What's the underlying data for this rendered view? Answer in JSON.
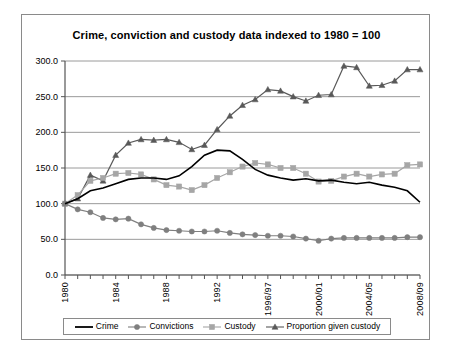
{
  "chart_data": {
    "type": "line",
    "title": "Crime, conviction and custody data indexed to 1980 = 100",
    "xlabel": "",
    "ylabel": "",
    "ylim": [
      0,
      300
    ],
    "yticks": [
      "0.0",
      "50.0",
      "100.0",
      "150.0",
      "200.0",
      "250.0",
      "300.0"
    ],
    "ytick_values": [
      0,
      50,
      100,
      150,
      200,
      250,
      300
    ],
    "grid": true,
    "legend_position": "bottom",
    "x": [
      "1980",
      "1981",
      "1982",
      "1983",
      "1984",
      "1985",
      "1986",
      "1987",
      "1988",
      "1989",
      "1990",
      "1991",
      "1992",
      "1993",
      "1994",
      "1995",
      "1996/97",
      "1997/98",
      "1998/99",
      "1999/00",
      "2000/01",
      "2001/02",
      "2002/03",
      "2003/04",
      "2004/05",
      "2005/06",
      "2006/07",
      "2007/08",
      "2008/09"
    ],
    "xtick_labels": [
      "1980",
      "1984",
      "1988",
      "1992",
      "1996/97",
      "2000/01",
      "2004/05",
      "2008/09"
    ],
    "xtick_indices": [
      0,
      4,
      8,
      12,
      16,
      20,
      24,
      28
    ],
    "series": [
      {
        "name": "Crime",
        "marker": "none",
        "color": "#000000",
        "values": [
          100,
          107,
          118,
          122,
          128,
          134,
          136,
          136,
          134,
          139,
          152,
          168,
          175,
          174,
          162,
          148,
          140,
          136,
          133,
          135,
          132,
          133,
          130,
          128,
          130,
          126,
          123,
          118,
          102
        ]
      },
      {
        "name": "Convictions",
        "marker": "circle",
        "color": "#7f7f7f",
        "values": [
          100,
          92,
          88,
          80,
          78,
          79,
          71,
          66,
          63,
          62,
          61,
          61,
          62,
          59,
          57,
          56,
          55,
          55,
          54,
          51,
          48,
          51,
          52,
          52,
          52,
          52,
          52,
          53,
          53
        ]
      },
      {
        "name": "Custody",
        "marker": "square",
        "color": "#a6a6a6",
        "values": [
          100,
          112,
          132,
          136,
          142,
          143,
          141,
          134,
          126,
          124,
          119,
          126,
          136,
          144,
          152,
          157,
          155,
          150,
          150,
          142,
          131,
          132,
          138,
          142,
          138,
          141,
          142,
          154,
          155
        ]
      },
      {
        "name": "Proportion given custody",
        "marker": "triangle",
        "color": "#595959",
        "values": [
          100,
          107,
          140,
          132,
          168,
          185,
          190,
          189,
          190,
          186,
          176,
          182,
          204,
          223,
          238,
          246,
          260,
          258,
          250,
          244,
          252,
          253,
          293,
          291,
          265,
          266,
          272,
          288,
          288
        ]
      }
    ]
  }
}
